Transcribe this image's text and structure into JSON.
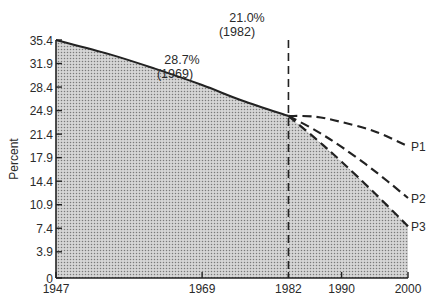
{
  "chart_data": {
    "type": "area",
    "title": "",
    "xlabel": "",
    "ylabel": "Percent",
    "xlim": [
      1947,
      2000
    ],
    "ylim": [
      0,
      35.4
    ],
    "grid": false,
    "legend": "inline labels at line ends",
    "x_ticks": [
      1947,
      1969,
      1982,
      1990,
      2000
    ],
    "y_ticks": [
      0,
      3.9,
      7.4,
      10.9,
      14.4,
      17.9,
      21.4,
      24.9,
      28.4,
      31.9,
      35.4
    ],
    "y_tick_labels": [
      "0",
      "3.9",
      "7.4",
      "10.9",
      "14.4",
      "17.9",
      "21.4",
      "24.9",
      "28.4",
      "31.9",
      "35.4"
    ],
    "x_tick_labels": [
      "1947",
      "1969",
      "1982",
      "1990",
      "2000"
    ],
    "series": [
      {
        "name": "Historical (shaded area)",
        "style": "solid",
        "x": [
          1947,
          1955,
          1962,
          1969,
          1975,
          1982
        ],
        "values": [
          35.4,
          33.3,
          31.1,
          28.7,
          26.4,
          24.1
        ]
      },
      {
        "name": "P1",
        "style": "dashed",
        "x": [
          1982,
          1986,
          1990,
          1995,
          2000
        ],
        "values": [
          24.1,
          24.0,
          23.2,
          21.8,
          19.6
        ]
      },
      {
        "name": "P2",
        "style": "dashed",
        "x": [
          1982,
          1986,
          1990,
          1995,
          2000
        ],
        "values": [
          24.1,
          22.0,
          19.5,
          15.9,
          11.9
        ]
      },
      {
        "name": "P3",
        "style": "dashed",
        "x": [
          1982,
          1986,
          1990,
          1995,
          2000
        ],
        "values": [
          24.1,
          20.8,
          17.3,
          12.6,
          7.7
        ]
      },
      {
        "name": "Projected area (shaded, follows P3)",
        "style": "fill",
        "x": [
          1982,
          2000
        ],
        "values": [
          24.1,
          7.7
        ]
      }
    ],
    "annotations": [
      {
        "text": "28.7%",
        "subtext": "(1969)",
        "x": 1969,
        "y": 28.7
      },
      {
        "text": "21.0%",
        "subtext": "(1982)",
        "x": 1982,
        "y": 35.4
      }
    ],
    "reference_lines": [
      {
        "orientation": "vertical",
        "x": 1982,
        "style": "dashed"
      }
    ]
  },
  "labels": {
    "ylabel": "Percent",
    "annot_1969_pct": "28.7%",
    "annot_1969_year": "(1969)",
    "annot_1982_pct": "21.0%",
    "annot_1982_year": "(1982)",
    "p1": "P1",
    "p2": "P2",
    "p3": "P3"
  },
  "colors": {
    "ink": "#222222",
    "fill": "#c8c8c8",
    "dot": "#7a7a7a"
  }
}
